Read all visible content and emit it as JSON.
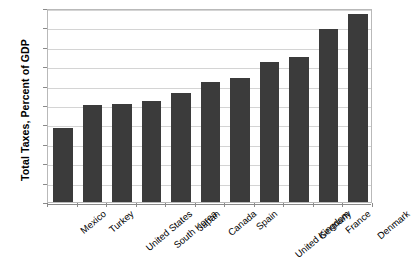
{
  "chart_data": {
    "type": "bar",
    "title": "",
    "xlabel": "",
    "ylabel": "Total Taxes, Percent of GDP",
    "ylim": [
      0,
      50
    ],
    "ytick_step": 5,
    "yticks": [
      "0",
      "5",
      "10",
      "15",
      "20",
      "25",
      "30",
      "35",
      "40",
      "45",
      "50"
    ],
    "grid": true,
    "legend": "none",
    "bar_color": "#3b3b3b",
    "categories": [
      "Mexico",
      "Turkey",
      "United States",
      "South Korea",
      "Japan",
      "Canada",
      "Spain",
      "United Kingdom",
      "Germany",
      "France",
      "Denmark"
    ],
    "values": [
      19,
      25,
      25.2,
      26,
      28,
      31,
      32,
      36,
      37.5,
      44.5,
      48.5
    ]
  }
}
